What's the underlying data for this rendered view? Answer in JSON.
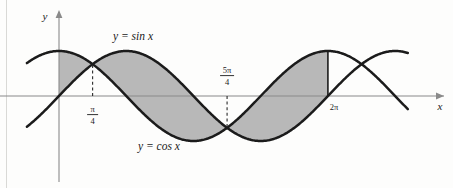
{
  "figure": {
    "background_color": "#fdfdfc",
    "shade_color": "#b8b8b8",
    "curve_color": "#1b1b1b",
    "axis_color": "#8a8a8a"
  },
  "axes": {
    "y_label": "y",
    "x_label": "x",
    "x_min_visible": -0.75,
    "x_max_visible": 8.15,
    "y_min_visible": -1.55,
    "y_max_visible": 1.55,
    "origin_px": {
      "x": 59,
      "y": 96
    },
    "px_per_radian": 42.8,
    "px_per_unit_y": 45
  },
  "curves": [
    {
      "name": "sine-curve",
      "label": "y = sin x",
      "function": "sin",
      "amplitude": 1,
      "label_pos": {
        "x": 113,
        "y": 40
      }
    },
    {
      "name": "cosine-curve",
      "label": "y = cos x",
      "function": "cos",
      "amplitude": 1,
      "label_pos": {
        "x": 138,
        "y": 150
      }
    }
  ],
  "ticks": [
    {
      "name": "tick-pi-over-4",
      "numerator": "π",
      "denominator": "4",
      "value_radians": 0.7853981634,
      "has_dashed_line": true,
      "dash_from": "axis",
      "dash_to": "intersection"
    },
    {
      "name": "tick-5pi-over-4",
      "numerator": "5π",
      "denominator": "4",
      "value_radians": 3.926990817,
      "has_dashed_line": true,
      "dash_from": "axis",
      "dash_to": "intersection"
    },
    {
      "name": "tick-2pi",
      "label": "2π",
      "value_radians": 6.283185307,
      "has_dashed_line": false,
      "has_cut_line": true
    }
  ],
  "shaded_regions": [
    {
      "name": "region-0-to-pi4",
      "from_radians": 0,
      "to_radians": 0.7853981634,
      "upper": "cos",
      "lower": "sin"
    },
    {
      "name": "region-pi4-to-5pi4",
      "from_radians": 0.7853981634,
      "to_radians": 3.926990817,
      "upper": "sin",
      "lower": "cos"
    },
    {
      "name": "region-5pi4-to-2pi",
      "from_radians": 3.926990817,
      "to_radians": 6.283185307,
      "upper": "cos",
      "lower": "sin"
    }
  ],
  "intersections": [
    {
      "name": "intersection-pi4",
      "x_radians": 0.7853981634,
      "y_value": 0.7071067812
    },
    {
      "name": "intersection-5pi4",
      "x_radians": 3.926990817,
      "y_value": -0.7071067812
    }
  ],
  "chart_data": {
    "type": "line",
    "xlabel": "x",
    "ylabel": "y",
    "xlim": [
      -0.75,
      8.15
    ],
    "ylim": [
      -1.55,
      1.55
    ],
    "grid": false,
    "legend": "inline-labels",
    "series": [
      {
        "name": "y = sin x",
        "function": "sin(x)"
      },
      {
        "name": "y = cos x",
        "function": "cos(x)"
      }
    ],
    "annotations": [
      "y = sin x",
      "y = cos x",
      "π/4",
      "5π/4",
      "2π"
    ],
    "shaded_interval": [
      0,
      6.283185307
    ]
  }
}
